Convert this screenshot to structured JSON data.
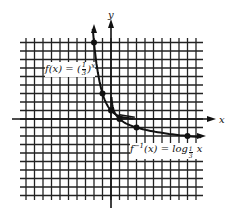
{
  "chart_data": {
    "type": "line",
    "title": "",
    "xlabel": "x",
    "ylabel": "y",
    "grid": true,
    "grid_units": {
      "xmin": -11,
      "xmax": 11,
      "ymin": -9,
      "ymax": 9
    },
    "series": [
      {
        "name": "f(x) = (1/3)^x",
        "points": [
          [
            -2,
            9
          ],
          [
            -1,
            3
          ],
          [
            0,
            1
          ],
          [
            1,
            0.333
          ],
          [
            2,
            0.111
          ]
        ]
      },
      {
        "name": "f^-1(x) = log_(1/3) x",
        "points": [
          [
            0.111,
            2
          ],
          [
            0.333,
            1
          ],
          [
            1,
            0
          ],
          [
            3,
            -1
          ],
          [
            9,
            -2
          ]
        ]
      }
    ],
    "marked_points": [
      [
        -2,
        9
      ],
      [
        -1,
        3
      ],
      [
        0,
        1
      ],
      [
        1,
        0
      ],
      [
        3,
        -1
      ],
      [
        9,
        -2
      ]
    ],
    "annotations": [
      {
        "text": "f(x) = (1/3)^x",
        "near": [
          -4,
          6
        ]
      },
      {
        "text": "f^-1(x) = log_1/3 x",
        "near": [
          5,
          -4
        ]
      }
    ]
  },
  "labels": {
    "x_axis": "x",
    "y_axis": "y",
    "f_prefix": "f(x) = (",
    "f_num": "1",
    "f_den": "3",
    "f_suffix": ")",
    "f_exp": "x",
    "inv_prefix": "f",
    "inv_sup": "−1",
    "inv_mid": "(x) = log",
    "inv_sub_num": "1",
    "inv_sub_den": "3",
    "inv_suffix": " x"
  }
}
